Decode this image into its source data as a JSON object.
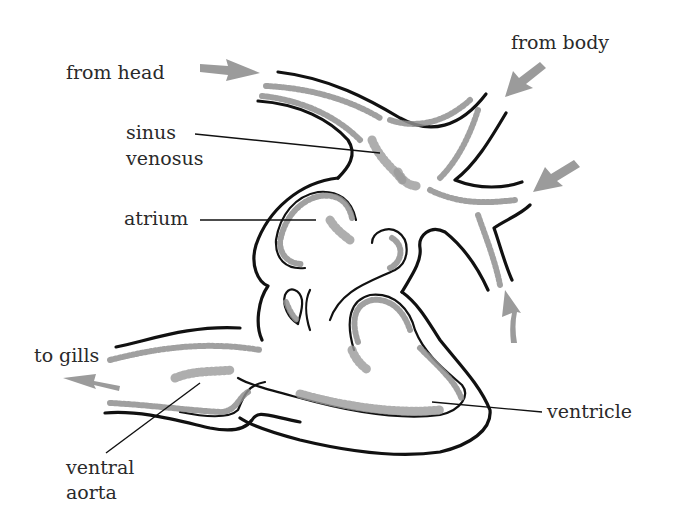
{
  "diagram": {
    "colors": {
      "outline": "#111111",
      "shading": "#8f8f8f",
      "arrow": "#9b9b9b",
      "text": "#2a2a2a",
      "background": "#ffffff"
    },
    "labels": {
      "from_head": "from head",
      "from_body": "from body",
      "sinus_line1": "sinus",
      "sinus_line2": "venosus",
      "atrium": "atrium",
      "to_gills": "to gills",
      "ventricle": "ventricle",
      "ventral_line1": "ventral",
      "ventral_line2": "aorta"
    },
    "flow_arrows": [
      {
        "name": "from-head-arrow",
        "direction": "right"
      },
      {
        "name": "from-body-arrow-top",
        "direction": "down-left"
      },
      {
        "name": "from-body-arrow-middle",
        "direction": "down-left"
      },
      {
        "name": "from-body-arrow-bottom",
        "direction": "up"
      },
      {
        "name": "to-gills-arrow",
        "direction": "left"
      }
    ]
  }
}
